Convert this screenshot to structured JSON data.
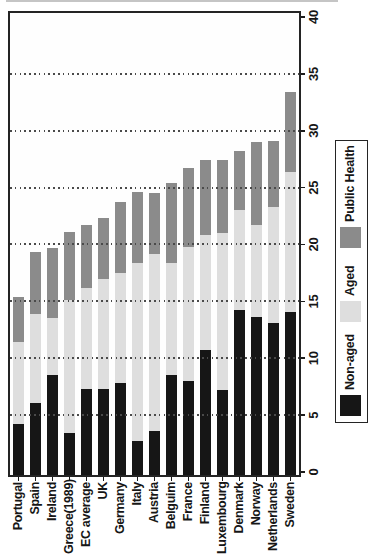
{
  "figure": {
    "note_rotation": "figure rotated 90deg counter-clockwise on page; all text reads bottom-to-top",
    "background": "#ffffff",
    "frame_color": "#242424"
  },
  "chart_data": {
    "type": "bar",
    "stacked": true,
    "orientation": "horizontal bars (countries on category axis), whole figure rotated 90deg CCW",
    "title": "",
    "xlabel": "",
    "ylabel": "",
    "categories": [
      "Portugal",
      "Spain",
      "Ireland",
      "Greece(1989)",
      "EC average",
      "UK",
      "Germany",
      "Italy",
      "Austria",
      "Belguim",
      "France",
      "Finland",
      "Luxembourg",
      "Denmark",
      "Norway",
      "Netherlands",
      "Sweden"
    ],
    "series": [
      {
        "name": "Non-aged",
        "color": "#161616",
        "values": [
          4.2,
          6.1,
          8.5,
          3.4,
          7.3,
          7.3,
          7.8,
          2.7,
          3.6,
          8.5,
          8.0,
          10.7,
          7.2,
          14.2,
          13.6,
          13.1,
          14.1
        ]
      },
      {
        "name": "Aged",
        "color": "#dedede",
        "values": [
          7.2,
          7.8,
          5.0,
          11.7,
          8.9,
          9.7,
          9.7,
          15.7,
          15.6,
          9.9,
          11.8,
          10.1,
          13.8,
          8.8,
          8.1,
          10.2,
          12.3
        ]
      },
      {
        "name": "Public Health",
        "color": "#8b8b8b",
        "values": [
          4.0,
          5.4,
          6.2,
          6.0,
          5.5,
          5.3,
          6.2,
          6.2,
          5.3,
          7.0,
          6.9,
          6.6,
          6.4,
          5.2,
          7.3,
          5.8,
          7.0
        ]
      }
    ],
    "totals": [
      15.4,
      19.3,
      19.7,
      21.1,
      21.7,
      22.3,
      23.7,
      24.6,
      24.5,
      25.4,
      26.7,
      27.4,
      27.4,
      28.2,
      29.0,
      29.1,
      33.4
    ],
    "value_axis": {
      "min": 0,
      "max": 40,
      "ticks": [
        0,
        5,
        10,
        15,
        20,
        25,
        30,
        35,
        40
      ],
      "gridlines": [
        5,
        10,
        15,
        20,
        25,
        30,
        35
      ],
      "grid_style": "dotted",
      "side": "value labels on outer edge of axis"
    },
    "legend": {
      "position": "outside plot, along axis side",
      "entries": [
        "Non-aged",
        "Aged",
        "Public Health"
      ]
    }
  }
}
